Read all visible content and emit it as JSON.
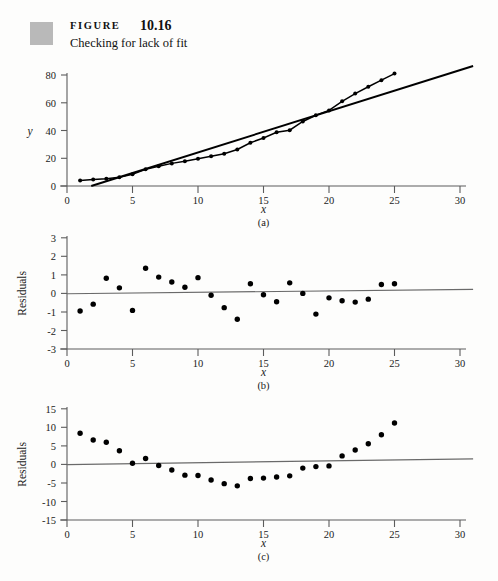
{
  "figure": {
    "label": "FIGURE",
    "number": "10.16",
    "caption": "Checking for lack of fit",
    "swatch_color": "#b9b9b9"
  },
  "chart_data": [
    {
      "id": "a",
      "type": "scatter",
      "title": "",
      "panel_caption": "(a)",
      "xlabel": "x",
      "ylabel": "y",
      "xlim": [
        0,
        31
      ],
      "ylim": [
        0,
        88
      ],
      "xticks": [
        0,
        5,
        10,
        15,
        20,
        25,
        30
      ],
      "yticks": [
        0,
        20,
        40,
        60,
        80
      ],
      "grid": false,
      "legend": "none",
      "x": [
        1,
        2,
        3,
        4,
        5,
        6,
        7,
        8,
        9,
        10,
        11,
        12,
        13,
        14,
        15,
        16,
        17,
        18,
        19,
        20,
        21,
        22,
        23,
        24,
        25
      ],
      "y": [
        4.0,
        4.6,
        5.2,
        6.3,
        8.4,
        12.0,
        14.3,
        16.3,
        17.8,
        19.6,
        21.4,
        23.2,
        26.3,
        31.2,
        34.6,
        38.7,
        40.2,
        46.5,
        51.0,
        54.5,
        61.0,
        66.6,
        71.5,
        76.3,
        81.0
      ],
      "overlays": [
        {
          "name": "smooth-curve-through-points",
          "kind": "line",
          "style": "thin-black"
        },
        {
          "name": "least-squares-straight-line",
          "kind": "line",
          "style": "thick-black",
          "x": [
            1.85,
            31.0
          ],
          "y": [
            0.0,
            86.5
          ]
        }
      ]
    },
    {
      "id": "b",
      "type": "scatter",
      "title": "",
      "panel_caption": "(b)",
      "xlabel": "x",
      "ylabel": "Residuals",
      "xlim": [
        0,
        31
      ],
      "ylim": [
        -3,
        3
      ],
      "xticks": [
        0,
        5,
        10,
        15,
        20,
        25,
        30
      ],
      "yticks": [
        3,
        2,
        1,
        0,
        -1,
        -2,
        -3
      ],
      "grid": false,
      "legend": "none",
      "x": [
        1,
        2,
        3,
        4,
        5,
        6,
        7,
        8,
        9,
        10,
        11,
        12,
        13,
        14,
        15,
        16,
        17,
        18,
        19,
        20,
        21,
        22,
        23,
        24,
        25
      ],
      "y": [
        -0.95,
        -0.58,
        0.82,
        0.3,
        -0.92,
        1.36,
        0.88,
        0.62,
        0.33,
        0.85,
        -0.1,
        -0.77,
        -1.4,
        0.52,
        -0.07,
        -0.45,
        0.57,
        0.0,
        -1.12,
        -0.24,
        -0.4,
        -0.47,
        -0.31,
        0.48,
        0.52
      ],
      "overlays": [
        {
          "name": "zero-reference-line",
          "kind": "line",
          "style": "gray",
          "x": [
            0,
            31
          ],
          "y": [
            -0.02,
            0.22
          ]
        }
      ]
    },
    {
      "id": "c",
      "type": "scatter",
      "title": "",
      "panel_caption": "(c)",
      "xlabel": "x",
      "ylabel": "Residuals",
      "xlim": [
        0,
        31
      ],
      "ylim": [
        -15,
        15
      ],
      "xticks": [
        0,
        5,
        10,
        15,
        20,
        25,
        30
      ],
      "yticks": [
        15,
        10,
        5,
        0,
        -5,
        -10,
        -15
      ],
      "grid": false,
      "legend": "none",
      "x": [
        1,
        2,
        3,
        4,
        5,
        6,
        7,
        8,
        9,
        10,
        11,
        12,
        13,
        14,
        15,
        16,
        17,
        18,
        19,
        20,
        21,
        22,
        23,
        24,
        25
      ],
      "y": [
        8.4,
        6.6,
        6.0,
        3.7,
        0.3,
        1.6,
        -0.3,
        -1.5,
        -2.9,
        -3.0,
        -4.2,
        -5.2,
        -5.8,
        -3.8,
        -3.7,
        -3.4,
        -3.1,
        -1.0,
        -0.6,
        -0.4,
        2.3,
        3.9,
        5.6,
        8.0,
        11.2
      ],
      "overlays": [
        {
          "name": "zero-reference-line",
          "kind": "line",
          "style": "gray",
          "x": [
            0,
            31
          ],
          "y": [
            -0.05,
            1.5
          ]
        }
      ]
    }
  ]
}
